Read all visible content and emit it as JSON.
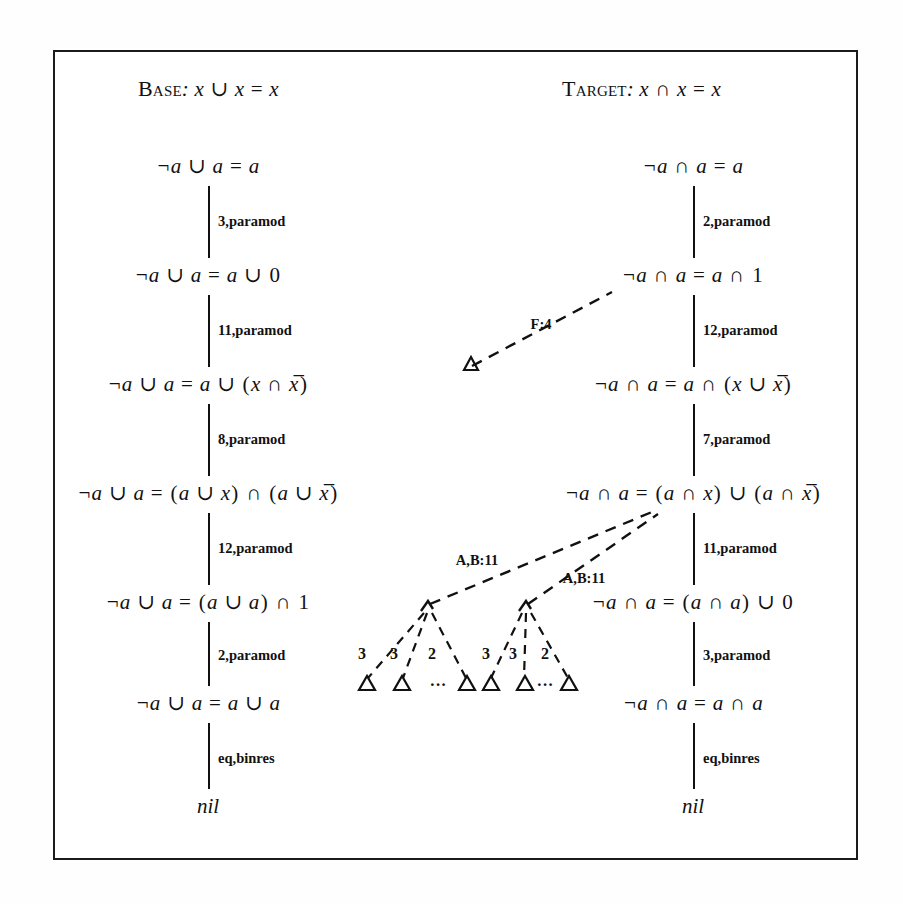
{
  "figure": {
    "border_color": "#1b1b1b",
    "background": "#ffffff"
  },
  "headers": {
    "base": {
      "caps": "Base",
      "rest": ": x ∪ x = x"
    },
    "target": {
      "caps": "Target",
      "rest": ": x ∩ x = x"
    }
  },
  "base_column": {
    "nodes": [
      "¬a ∪ a = a",
      "¬a ∪ a = a ∪ 0",
      "¬a ∪ a = a ∪ (x ∩ x̅)",
      "¬a ∪ a = (a ∪ x) ∩ (a ∪ x̅)",
      "¬a ∪ a = (a ∪ a) ∩ 1",
      "¬a ∪ a = a ∪ a"
    ],
    "edges": [
      "3,paramod",
      "11,paramod",
      "8,paramod",
      "12,paramod",
      "2,paramod",
      "eq,binres"
    ],
    "terminal": "nil"
  },
  "target_column": {
    "nodes": [
      "¬a ∩ a = a",
      "¬a ∩ a = a ∩ 1",
      "¬a ∩ a = a ∩ (x ∪ x̅)",
      "¬a ∩ a = (a ∩ x) ∪ (a ∩ x̅)",
      "¬a ∩ a = (a ∩ a) ∪ 0",
      "¬a ∩ a = a ∩ a"
    ],
    "edges": [
      "2,paramod",
      "12,paramod",
      "7,paramod",
      "11,paramod",
      "3,paramod",
      "eq,binres"
    ],
    "terminal": "nil"
  },
  "analogy_links": {
    "f4": "F:4",
    "ab11_left": "A,B:11",
    "ab11_right": "A,B:11"
  },
  "subtrees": {
    "left": {
      "child_labels": [
        "3",
        "3",
        "2"
      ],
      "ellipsis": "···"
    },
    "right": {
      "child_labels": [
        "3",
        "3",
        "2"
      ],
      "ellipsis": "···"
    }
  }
}
